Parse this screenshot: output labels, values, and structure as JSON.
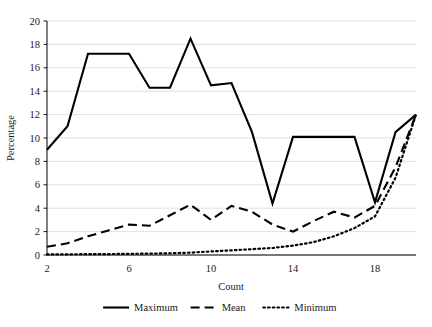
{
  "chart_data": {
    "type": "line",
    "title": "",
    "xlabel": "Count",
    "ylabel": "Percentage",
    "xlim": [
      2,
      20
    ],
    "ylim": [
      0,
      20
    ],
    "xticks": [
      2,
      6,
      10,
      14,
      18
    ],
    "yticks": [
      0,
      2,
      4,
      6,
      8,
      10,
      12,
      14,
      16,
      18,
      20
    ],
    "xtick_labels": [
      "2",
      "6",
      "10",
      "14",
      "18"
    ],
    "ytick_labels": [
      "0",
      "2",
      "4",
      "6",
      "8",
      "10",
      "12",
      "14",
      "16",
      "18",
      "20"
    ],
    "grid": "horizontal",
    "grid_color": "#d9d9d9",
    "axis_color": "#000000",
    "legend_position": "bottom",
    "x": [
      2,
      3,
      4,
      5,
      6,
      7,
      8,
      9,
      10,
      11,
      12,
      13,
      14,
      15,
      16,
      17,
      18,
      19,
      20
    ],
    "series": [
      {
        "name": "Maximum",
        "style": "solid",
        "color": "#000000",
        "values": [
          9.0,
          11.0,
          17.2,
          17.2,
          17.2,
          14.3,
          14.3,
          18.5,
          14.5,
          14.7,
          10.5,
          4.4,
          10.1,
          10.1,
          10.1,
          10.1,
          4.5,
          10.5,
          12.0
        ]
      },
      {
        "name": "Mean",
        "style": "dashed",
        "color": "#000000",
        "values": [
          0.7,
          1.0,
          1.6,
          2.1,
          2.6,
          2.5,
          3.4,
          4.3,
          3.0,
          4.2,
          3.7,
          2.6,
          2.0,
          2.9,
          3.7,
          3.2,
          4.2,
          7.5,
          12.0
        ]
      },
      {
        "name": "Minimum",
        "style": "dotted",
        "color": "#000000",
        "values": [
          0.05,
          0.06,
          0.07,
          0.08,
          0.1,
          0.12,
          0.15,
          0.2,
          0.3,
          0.4,
          0.5,
          0.6,
          0.8,
          1.1,
          1.6,
          2.3,
          3.3,
          6.6,
          12.0
        ]
      }
    ]
  },
  "legend": {
    "items": [
      {
        "label": "Maximum",
        "style": "solid"
      },
      {
        "label": "Mean",
        "style": "dashed"
      },
      {
        "label": "Minimum",
        "style": "dotted"
      }
    ]
  }
}
